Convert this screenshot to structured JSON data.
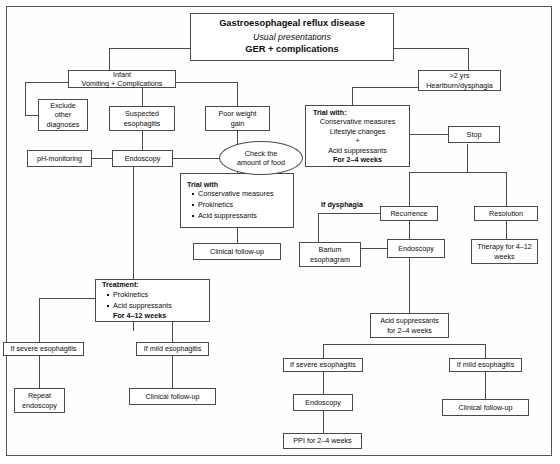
{
  "diagram": {
    "title_box": {
      "line1": "Gastroesophageal reflux disease",
      "line2": "Usual presentations",
      "line3": "GER + complications"
    },
    "nodes": {
      "infant": {
        "line1": "Infant",
        "line2": "Vomiting + Complications"
      },
      "exclude": {
        "line1": "Exclude",
        "line2": "other",
        "line3": "diagnoses"
      },
      "suspected": {
        "line1": "Suspected",
        "line2": "esophagitis"
      },
      "poor_weight": {
        "line1": "Poor weight",
        "line2": "gain"
      },
      "ph_monitoring": {
        "line1": "pH-monitoring"
      },
      "endoscopy_left": {
        "line1": "Endoscopy"
      },
      "check_food": {
        "line1": "Check the",
        "line2": "amount of food"
      },
      "trial_with_infant": {
        "header": "Trial with",
        "items": [
          "Conservative measures",
          "Prokinetics",
          "Acid suppressants"
        ]
      },
      "clinical_followup_infant": {
        "line1": "Clinical follow-up"
      },
      "treatment": {
        "header": "Treatment:",
        "items": [
          "Prokinetics",
          "Acid suppressants"
        ],
        "footer": "For 4–12 weeks"
      },
      "if_severe_left": {
        "line1": "If severe esophagitis"
      },
      "if_mild_left": {
        "line1": "If mild esophagitis"
      },
      "repeat_endoscopy": {
        "line1": "Repeat",
        "line2": "endoscopy"
      },
      "clinical_followup_left": {
        "line1": "Clinical follow-up"
      },
      "over2yrs": {
        "line1": ">2 yrs",
        "line2": "Heartburn/dysphagia"
      },
      "trial_with_older": {
        "header": "Trial with:",
        "line1": "Conservative measures",
        "line2": "Lifestyle changes",
        "plus": "+",
        "line3": "Acid suppressants",
        "footer": "For 2–4 weeks"
      },
      "stop": {
        "line1": "Stop"
      },
      "recurrence": {
        "line1": "Recurrence"
      },
      "resolution": {
        "line1": "Resolution"
      },
      "therapy": {
        "line1": "Therapy for 4–12",
        "line2": "weeks"
      },
      "barium": {
        "line1": "Barium",
        "line2": "esophagram"
      },
      "endoscopy_right": {
        "line1": "Endoscopy"
      },
      "acid_suppressants": {
        "line1": "Acid suppressants",
        "line2": "for 2–4 weeks"
      },
      "if_severe_right": {
        "line1": "If severe esophagitis"
      },
      "if_mild_right": {
        "line1": "If mild esophagitis"
      },
      "endoscopy_bottom": {
        "line1": "Endoscopy"
      },
      "ppi": {
        "line1": "PPI for 2–4 weeks"
      },
      "clinical_followup_right": {
        "line1": "Clinical follow-up"
      }
    },
    "edge_labels": {
      "if_dysphagia": "If dysphagia"
    },
    "colors": {
      "border": "#4a4a4a",
      "text": "#0d0d0d",
      "background": "#ffffff",
      "frame": "#555555"
    }
  }
}
